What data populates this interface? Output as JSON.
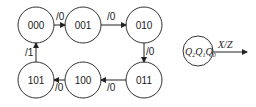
{
  "diagram": {
    "type": "state-transition-diagram",
    "states": [
      {
        "id": "s000",
        "label": "000",
        "cx": 36,
        "cy": 25
      },
      {
        "id": "s001",
        "label": "001",
        "cx": 83,
        "cy": 25
      },
      {
        "id": "s010",
        "label": "010",
        "cx": 144,
        "cy": 25
      },
      {
        "id": "s011",
        "label": "011",
        "cx": 144,
        "cy": 80
      },
      {
        "id": "s100",
        "label": "100",
        "cx": 83,
        "cy": 80
      },
      {
        "id": "s101",
        "label": "101",
        "cx": 36,
        "cy": 80
      }
    ],
    "transitions": [
      {
        "from": "000",
        "to": "001",
        "label": "/0"
      },
      {
        "from": "001",
        "to": "010",
        "label": "/0"
      },
      {
        "from": "010",
        "to": "011",
        "label": "/0"
      },
      {
        "from": "011",
        "to": "100",
        "label": "/0"
      },
      {
        "from": "100",
        "to": "101",
        "label": "/0"
      },
      {
        "from": "101",
        "to": "000",
        "label": "/1"
      }
    ],
    "legend": {
      "state_vars": [
        "Q",
        "Q",
        "Q"
      ],
      "state_subs": [
        "2",
        "1",
        "0"
      ],
      "arrow_label": "X/Z"
    }
  }
}
